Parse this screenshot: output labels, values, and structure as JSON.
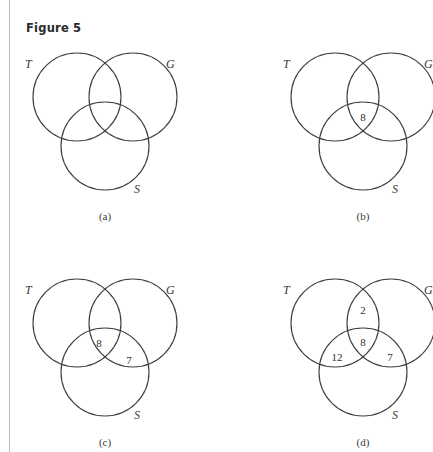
{
  "figure": {
    "title": "Figure 5",
    "margin_rule_color": "#b9b9b9",
    "stroke_color": "#3f3f44",
    "background_color": "#ffffff"
  },
  "panels": [
    {
      "id": "a",
      "caption": "(a)",
      "set_labels": {
        "t": "T",
        "g": "G",
        "s": "S"
      },
      "regions": []
    },
    {
      "id": "b",
      "caption": "(b)",
      "set_labels": {
        "t": "T",
        "g": "G",
        "s": "S"
      },
      "regions": [
        {
          "name": "t-and-g-and-s",
          "value": "8"
        }
      ]
    },
    {
      "id": "c",
      "caption": "(c)",
      "set_labels": {
        "t": "T",
        "g": "G",
        "s": "S"
      },
      "regions": [
        {
          "name": "t-and-g-and-s",
          "value": "8"
        },
        {
          "name": "g-and-s-only",
          "value": "7"
        }
      ]
    },
    {
      "id": "d",
      "caption": "(d)",
      "set_labels": {
        "t": "T",
        "g": "G",
        "s": "S"
      },
      "regions": [
        {
          "name": "t-and-g-only",
          "value": "2"
        },
        {
          "name": "t-and-g-and-s",
          "value": "8"
        },
        {
          "name": "t-and-s-only",
          "value": "12"
        },
        {
          "name": "g-and-s-only",
          "value": "7"
        }
      ]
    }
  ]
}
